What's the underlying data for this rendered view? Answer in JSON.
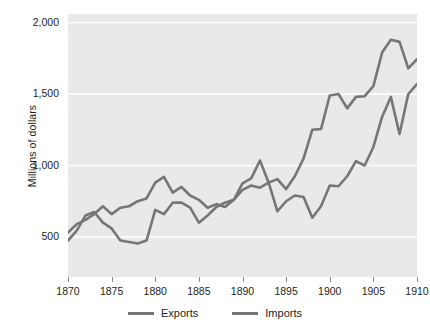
{
  "chart_data": {
    "type": "line",
    "title": "",
    "xlabel": "",
    "ylabel": "Millions of dollars",
    "xlim": [
      1870,
      1910
    ],
    "ylim": [
      220,
      2060
    ],
    "grid": true,
    "legend_position": "bottom",
    "yticks": [
      "500",
      "1,000",
      "1,500",
      "2,000"
    ],
    "ytick_values": [
      500,
      1000,
      1500,
      2000
    ],
    "xticks": [
      "1870",
      "1875",
      "1880",
      "1885",
      "1890",
      "1895",
      "1900",
      "1905",
      "1910"
    ],
    "xtick_values": [
      1870,
      1875,
      1880,
      1885,
      1890,
      1895,
      1900,
      1905,
      1910
    ],
    "x": [
      1870,
      1871,
      1872,
      1873,
      1874,
      1875,
      1876,
      1877,
      1878,
      1879,
      1880,
      1881,
      1882,
      1883,
      1884,
      1885,
      1886,
      1887,
      1888,
      1889,
      1890,
      1891,
      1892,
      1893,
      1894,
      1895,
      1896,
      1897,
      1898,
      1899,
      1900,
      1901,
      1902,
      1903,
      1904,
      1905,
      1906,
      1907,
      1908,
      1909,
      1910
    ],
    "series": [
      {
        "name": "Exports",
        "color": "#767676",
        "values": [
          530,
          590,
          620,
          660,
          715,
          660,
          705,
          715,
          750,
          770,
          880,
          920,
          810,
          850,
          790,
          760,
          705,
          730,
          710,
          760,
          875,
          910,
          1035,
          880,
          905,
          835,
          925,
          1050,
          1250,
          1255,
          1490,
          1500,
          1400,
          1480,
          1485,
          1555,
          1790,
          1880,
          1865,
          1680,
          1745
        ]
      },
      {
        "name": "Imports",
        "color": "#767676",
        "values": [
          475,
          545,
          650,
          675,
          600,
          560,
          475,
          465,
          455,
          475,
          690,
          660,
          740,
          740,
          705,
          600,
          650,
          710,
          740,
          760,
          830,
          860,
          845,
          880,
          680,
          750,
          790,
          780,
          635,
          715,
          860,
          855,
          925,
          1030,
          1000,
          1130,
          1340,
          1480,
          1220,
          1500,
          1570
        ]
      }
    ]
  },
  "legend": {
    "items": [
      {
        "label": "Exports"
      },
      {
        "label": "Imports"
      }
    ]
  }
}
